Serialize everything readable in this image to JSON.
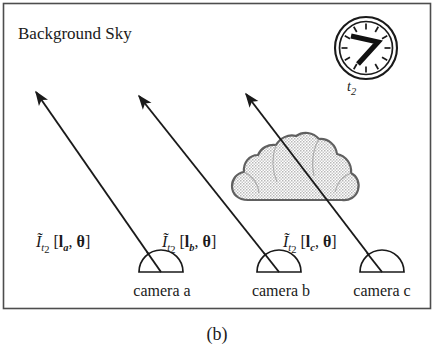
{
  "figure": {
    "caption": "(b)",
    "background_label": "Background Sky",
    "border_color": "#4d4d4d",
    "background_color": "#ffffff",
    "ink_color": "#1a1a1a"
  },
  "clock": {
    "name": "analog-clock",
    "label": "t",
    "label_sub": "2",
    "hour_marks": 12,
    "hand_long_angle_oclock": "2",
    "hand_short_angle_oclock": "7",
    "ring_color": "#1a1a1a",
    "face_color": "#ffffff"
  },
  "cloud": {
    "name": "cloud",
    "fill_color": "#d0d0d0",
    "outline_color": "#555555"
  },
  "cameras": [
    {
      "id": "a",
      "label": "camera a",
      "x": 162,
      "y": 281
    },
    {
      "id": "b",
      "label": "camera b",
      "x": 281,
      "y": 281
    },
    {
      "id": "c",
      "label": "camera c",
      "x": 382,
      "y": 281
    }
  ],
  "rays": [
    {
      "id": "a",
      "name": "ray-camera-a",
      "label": {
        "symbol": "I",
        "tilde": true,
        "time_sub": "t",
        "time_sub2": "2",
        "open": "[",
        "vector": "l",
        "vector_sub": "a",
        "comma": ",",
        "angle": "θ",
        "close": "]"
      },
      "label_text": "Ĩt2[la, θ]",
      "from_x": 161,
      "from_y": 272,
      "to_x": 33,
      "to_y": 88,
      "label_x": 40,
      "label_y": 243
    },
    {
      "id": "b",
      "name": "ray-camera-b",
      "label": {
        "symbol": "I",
        "tilde": true,
        "time_sub": "t",
        "time_sub2": "2",
        "open": "[",
        "vector": "l",
        "vector_sub": "b",
        "comma": ",",
        "angle": "θ",
        "close": "]"
      },
      "label_text": "Ĩt2[lb, θ]",
      "from_x": 279,
      "from_y": 272,
      "to_x": 136,
      "to_y": 92,
      "label_x": 166,
      "label_y": 243
    },
    {
      "id": "c",
      "name": "ray-camera-c",
      "label": {
        "symbol": "I",
        "tilde": true,
        "time_sub": "t",
        "time_sub2": "2",
        "open": "[",
        "vector": "l",
        "vector_sub": "c",
        "comma": ",",
        "angle": "θ",
        "close": "]"
      },
      "label_text": "Ĩt2[lc, θ]",
      "from_x": 382,
      "from_y": 272,
      "to_x": 243,
      "to_y": 90,
      "label_x": 287,
      "label_y": 243
    }
  ]
}
